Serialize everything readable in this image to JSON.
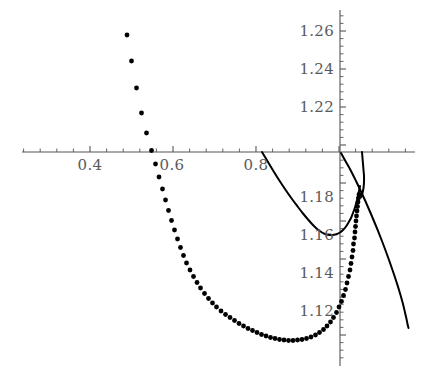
{
  "chart_data": {
    "type": "scatter",
    "title": "",
    "xlabel": "",
    "ylabel": "",
    "grid": false,
    "legend": null,
    "axes": {
      "x_axis_y_value": 1.2005,
      "y_axis_x_value": 0.9585,
      "x_range": [
        0.295,
        1.1
      ],
      "y_range": [
        1.107,
        1.275
      ],
      "x_pixel_range": [
        22,
        415
      ],
      "y_pixel_range": [
        10,
        366
      ],
      "x_major_step": 0.2,
      "x_minor_step": 0.04,
      "y_major_step": 0.02,
      "y_minor_step": 0.004
    },
    "xticks": [
      {
        "value": 0.4,
        "label": "0.4",
        "px": 90
      },
      {
        "value": 0.6,
        "label": "0.6",
        "px": 172
      },
      {
        "value": 0.8,
        "label": "0.8",
        "px": 256
      }
    ],
    "yticks": [
      {
        "value": 1.26,
        "label": "1.26",
        "py": 31
      },
      {
        "value": 1.24,
        "label": "1.24",
        "py": 69
      },
      {
        "value": 1.22,
        "label": "1.22",
        "py": 107
      },
      {
        "value": 1.18,
        "label": "1.18",
        "py": 197
      },
      {
        "value": 1.16,
        "label": "1.16",
        "py": 235
      },
      {
        "value": 1.14,
        "label": "1.14",
        "py": 273
      },
      {
        "value": 1.12,
        "label": "1.12",
        "py": 311
      }
    ],
    "series": [
      {
        "name": "dotted-branch",
        "type": "scatter",
        "marker": "dot",
        "marker_radius_px": 2.4,
        "color": "#000000",
        "points_px": [
          [
            127.0,
            35.0
          ],
          [
            131.5,
            61.0
          ],
          [
            136.5,
            88.0
          ],
          [
            141.5,
            113.0
          ],
          [
            146.5,
            133.0
          ],
          [
            151.5,
            150.5
          ],
          [
            155.5,
            164.0
          ],
          [
            159.0,
            177.0
          ],
          [
            162.5,
            189.0
          ],
          [
            165.5,
            200.0
          ],
          [
            168.5,
            210.5
          ],
          [
            171.5,
            220.5
          ],
          [
            174.5,
            230.0
          ],
          [
            177.5,
            239.0
          ],
          [
            180.5,
            247.5
          ],
          [
            183.5,
            255.5
          ],
          [
            186.5,
            263.0
          ],
          [
            190.0,
            270.0
          ],
          [
            193.5,
            276.5
          ],
          [
            197.0,
            282.5
          ],
          [
            200.5,
            288.0
          ],
          [
            204.5,
            293.5
          ],
          [
            208.5,
            298.5
          ],
          [
            212.5,
            303.0
          ],
          [
            216.5,
            307.0
          ],
          [
            221.0,
            311.0
          ],
          [
            225.5,
            314.5
          ],
          [
            230.0,
            317.5
          ],
          [
            234.5,
            320.5
          ],
          [
            239.0,
            323.5
          ],
          [
            243.5,
            326.0
          ],
          [
            248.0,
            328.5
          ],
          [
            252.5,
            330.5
          ],
          [
            257.0,
            332.5
          ],
          [
            261.5,
            334.5
          ],
          [
            266.0,
            336.0
          ],
          [
            270.5,
            337.5
          ],
          [
            275.0,
            338.5
          ],
          [
            279.5,
            339.5
          ],
          [
            284.0,
            340.0
          ],
          [
            288.5,
            340.5
          ],
          [
            293.0,
            340.5
          ],
          [
            297.5,
            340.0
          ],
          [
            302.0,
            339.5
          ],
          [
            306.5,
            338.5
          ],
          [
            311.0,
            337.0
          ],
          [
            315.5,
            335.0
          ],
          [
            319.5,
            332.5
          ],
          [
            323.5,
            329.5
          ],
          [
            327.0,
            326.0
          ],
          [
            330.5,
            322.0
          ],
          [
            333.5,
            317.5
          ],
          [
            336.5,
            312.5
          ],
          [
            339.0,
            307.0
          ],
          [
            341.5,
            301.5
          ],
          [
            343.5,
            295.5
          ],
          [
            345.5,
            289.5
          ],
          [
            347.0,
            283.0
          ],
          [
            348.5,
            276.5
          ],
          [
            350.0,
            270.0
          ],
          [
            351.0,
            263.5
          ],
          [
            352.0,
            257.0
          ],
          [
            353.0,
            250.5
          ],
          [
            353.5,
            244.0
          ],
          [
            354.5,
            238.0
          ],
          [
            355.0,
            232.0
          ],
          [
            355.5,
            226.5
          ],
          [
            356.0,
            221.0
          ],
          [
            356.5,
            216.0
          ],
          [
            357.0,
            211.0
          ],
          [
            357.5,
            206.5
          ],
          [
            358.0,
            202.0
          ],
          [
            358.5,
            198.0
          ],
          [
            359.0,
            194.5
          ]
        ]
      },
      {
        "name": "solid-u-branch",
        "type": "line",
        "color": "#000000",
        "path_px": [
          [
            262.0,
            152.0
          ],
          [
            268.0,
            162.0
          ],
          [
            274.0,
            172.0
          ],
          [
            280.0,
            181.5
          ],
          [
            286.0,
            190.5
          ],
          [
            292.0,
            199.0
          ],
          [
            298.0,
            207.0
          ],
          [
            303.0,
            213.5
          ],
          [
            308.0,
            219.5
          ],
          [
            312.0,
            224.0
          ],
          [
            316.0,
            228.0
          ],
          [
            319.0,
            230.5
          ],
          [
            322.0,
            232.5
          ],
          [
            325.0,
            234.0
          ],
          [
            328.0,
            234.8
          ],
          [
            331.0,
            235.0
          ],
          [
            334.0,
            234.8
          ],
          [
            337.0,
            234.0
          ],
          [
            340.0,
            232.5
          ],
          [
            343.0,
            230.0
          ],
          [
            346.0,
            226.5
          ],
          [
            348.5,
            222.5
          ],
          [
            351.0,
            218.0
          ],
          [
            353.0,
            213.0
          ],
          [
            355.0,
            207.5
          ],
          [
            356.5,
            202.0
          ],
          [
            358.0,
            196.5
          ],
          [
            359.0,
            191.0
          ],
          [
            360.0,
            186.0
          ]
        ]
      },
      {
        "name": "solid-descending-branch",
        "type": "line",
        "color": "#000000",
        "path_px": [
          [
            341.0,
            153.0
          ],
          [
            346.0,
            162.0
          ],
          [
            351.0,
            171.0
          ],
          [
            356.0,
            181.0
          ],
          [
            361.0,
            191.5
          ],
          [
            366.0,
            202.5
          ],
          [
            371.0,
            214.0
          ],
          [
            376.0,
            226.0
          ],
          [
            381.0,
            238.5
          ],
          [
            385.0,
            249.0
          ],
          [
            389.0,
            260.0
          ],
          [
            393.0,
            271.5
          ],
          [
            396.0,
            280.5
          ],
          [
            399.0,
            290.0
          ],
          [
            401.5,
            298.5
          ],
          [
            403.5,
            306.0
          ],
          [
            405.0,
            312.5
          ],
          [
            406.5,
            319.0
          ],
          [
            407.5,
            324.0
          ],
          [
            408.5,
            328.0
          ]
        ]
      },
      {
        "name": "solid-upper-right-branch",
        "type": "line",
        "color": "#000000",
        "path_px": [
          [
            362.0,
            152.0
          ],
          [
            362.5,
            158.0
          ],
          [
            363.0,
            164.0
          ],
          [
            363.5,
            170.0
          ],
          [
            364.0,
            176.0
          ],
          [
            364.0,
            182.0
          ],
          [
            363.5,
            188.0
          ],
          [
            362.5,
            193.0
          ],
          [
            361.0,
            197.5
          ]
        ]
      }
    ],
    "colors": {
      "axis": "#555555",
      "tick_label": "#5a5a5a",
      "curve": "#000000",
      "background": "#ffffff"
    }
  }
}
